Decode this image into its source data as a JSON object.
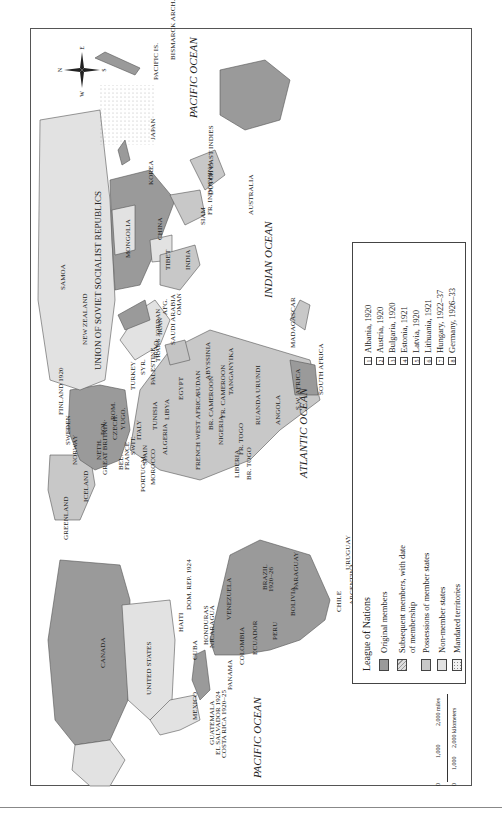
{
  "title": "League of Nations",
  "colors": {
    "original_members": "#9a9a9a",
    "subsequent_members": "#c4c4c4",
    "possessions": "#c8c8c8",
    "non_member": "#e2e2e2",
    "mandated": "#f2f2f2",
    "border": "#555555"
  },
  "compass": {
    "n": "N",
    "s": "S",
    "e": "E",
    "w": "W"
  },
  "oceans": {
    "pacific_east": "PACIFIC OCEAN",
    "pacific_west": "PACIFIC OCEAN",
    "atlantic": "ATLANTIC OCEAN",
    "indian": "INDIAN OCEAN"
  },
  "labels": {
    "canada": "CANADA",
    "united_states": "UNITED STATES",
    "mexico": "MEXICO",
    "cuba": "CUBA",
    "haiti": "HAITI",
    "dom_rep": "DOM. REP. 1924",
    "honduras": "HONDURAS",
    "nicaragua": "NICARAGUA",
    "guatemala": "GUATEMALA",
    "el_salvador": "EL SALVADOR 1924",
    "costa_rica": "COSTA RICA 1920–25",
    "panama": "PANAMA",
    "venezuela": "VENEZUELA",
    "colombia": "COLOMBIA",
    "ecuador": "ECUADOR",
    "peru": "PERU",
    "brazil": "BRAZIL",
    "brazil_date": "1920–26",
    "bolivia": "BOLIVIA",
    "paraguay": "PARAGUAY",
    "chile": "CHILE",
    "argentina": "ARGENTINA",
    "uruguay": "URUGUAY",
    "greenland": "GREENLAND",
    "iceland": "ICELAND",
    "norway": "NORWAY",
    "sweden": "SWEDEN",
    "finland": "FINLAND 1920",
    "neth": "NETH.",
    "great_britain": "GREAT BRITAIN",
    "bel": "BEL.",
    "france": "FRANCE",
    "portugal": "PORTUGAL",
    "spain": "SPAIN",
    "swit": "SWIT.",
    "italy": "ITALY",
    "pol": "POL.",
    "czech": "CZECH.",
    "rom": "ROM.",
    "yugo": "YUGO.",
    "turkey": "TURKEY",
    "syr": "SYR.",
    "palestine": "PALESTINE",
    "trans_jordan": "TRANS JORDAN",
    "iraq": "IRAQ",
    "iran": "IRAN",
    "afg": "AFG.",
    "saudi_arabia": "SAUDI ARABIA",
    "oman": "OMAN",
    "morocco": "MOROCCO",
    "algeria": "ALGERIA",
    "tunisia": "TUNISIA",
    "libya": "LIBYA",
    "egypt": "EGYPT",
    "sudan": "SUDAN",
    "abyssinia": "ABYSSINIA",
    "french_west_africa": "FRENCH WEST AFRICA",
    "br_cameroon": "BR. CAMEROON",
    "fr_cameroon": "FR. CAMEROON",
    "nigeria": "NIGERIA",
    "liberia": "LIBERIA",
    "br_togo": "BR. TOGO",
    "fr_togo": "FR. TOGO",
    "ruanda_urundi": "RUANDA URUNDI",
    "tanganyika": "TANGANYIKA",
    "angola": "ANGOLA",
    "sw_africa": "S.W. AFRICA",
    "south_africa": "SOUTH AFRICA",
    "madagascar": "MADAGASCAR",
    "ussr": "UNION OF SOVIET SOCIALIST REPUBLICS",
    "mongolia": "MONGOLIA",
    "china": "CHINA",
    "tibet": "TIBET",
    "india": "INDIA",
    "siam": "SIAM",
    "fr_indochina": "FR. INDOCHINA",
    "korea": "KOREA",
    "japan": "JAPAN",
    "dutch_east_indies": "DUTCH EAST INDIES",
    "pacific_is": "PACIFIC IS.",
    "bismarck_arch": "BISMARCK ARCH.",
    "australia": "AUSTRALIA",
    "new_zealand": "NEW ZEALAND",
    "samoa": "SAMOA"
  },
  "legend": {
    "title": "League of Nations",
    "items": [
      {
        "label": "Original members",
        "key": "original"
      },
      {
        "label": "Subsequent members, with date of membership",
        "key": "subsequent"
      },
      {
        "label": "Possessions of member states",
        "key": "possessions"
      },
      {
        "label": "Non-member states",
        "key": "non_member"
      },
      {
        "label": "Mandated territories",
        "key": "mandated"
      }
    ],
    "numbered": [
      {
        "n": "1",
        "label": "Albania, 1920"
      },
      {
        "n": "2",
        "label": "Austria, 1920"
      },
      {
        "n": "3",
        "label": "Bulgaria, 1920"
      },
      {
        "n": "4",
        "label": "Estonia, 1921"
      },
      {
        "n": "5",
        "label": "Latvia, 1920"
      },
      {
        "n": "6",
        "label": "Lithuania, 1921"
      },
      {
        "n": "7",
        "label": "Hungary, 1922–37"
      },
      {
        "n": "8",
        "label": "Germany, 1926–33"
      }
    ]
  },
  "scale": {
    "miles_ticks": [
      "0",
      "1,000",
      "2,000 miles"
    ],
    "km_ticks": [
      "0",
      "1,000",
      "2,000 kilometers"
    ]
  }
}
